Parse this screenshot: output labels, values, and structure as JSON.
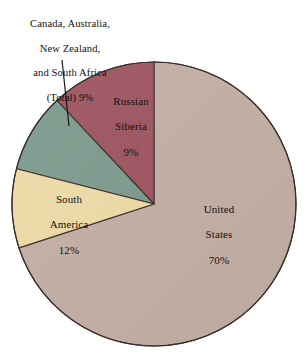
{
  "chart_data": {
    "type": "pie",
    "title": "",
    "subtitle": "",
    "xlabel": "",
    "ylabel": "",
    "legend_position": "none",
    "grid": false,
    "start_angle_deg": 90,
    "direction": "clockwise",
    "units": "percent",
    "categories": [
      "United States",
      "Russian Siberia",
      "Canada, Australia, New Zealand, and South Africa (Total)",
      "South America"
    ],
    "values": [
      70,
      9,
      9,
      12
    ],
    "slices": [
      {
        "id": "united-states",
        "label": "United States",
        "label_lines": [
          "United",
          "States"
        ],
        "value": 70,
        "value_text": "70%",
        "color": "#c4b0a6",
        "label_placement": "inside"
      },
      {
        "id": "russian-siberia",
        "label": "Russian Siberia",
        "label_lines": [
          "Russian",
          "Siberia"
        ],
        "value": 9,
        "value_text": "9%",
        "color": "#f0dca8",
        "label_placement": "inside"
      },
      {
        "id": "canada-australia-nz-south-africa",
        "label": "Canada, Australia, New Zealand, and South Africa (Total)",
        "label_lines": [
          "Canada, Australia,",
          "New Zealand,",
          "and South Africa",
          "(Total)  9%"
        ],
        "value": 9,
        "value_text": "9%",
        "color": "#7e9b8e",
        "label_placement": "outside-callout"
      },
      {
        "id": "south-america",
        "label": "South America",
        "label_lines": [
          "South",
          "America"
        ],
        "value": 12,
        "value_text": "12%",
        "color": "#9e5561",
        "label_placement": "inside"
      }
    ]
  },
  "labels": {
    "callout": {
      "line1": "Canada, Australia,",
      "line2": "New Zealand,",
      "line3": "and South Africa",
      "line4": "(Total)  9%"
    },
    "russian_siberia": {
      "line1": "Russian",
      "line2": "Siberia",
      "pct": "9%"
    },
    "south_america": {
      "line1": "South",
      "line2": "America",
      "pct": "12%"
    },
    "united_states": {
      "line1": "United",
      "line2": "States",
      "pct": "70%"
    }
  },
  "colors": {
    "united_states": "#c4b0a6",
    "russian_siberia": "#f0dca8",
    "canada_group": "#7e9b8e",
    "south_america": "#9e5561",
    "outline": "#3a2f2b",
    "background": "#ffffff",
    "text": "#151210"
  }
}
